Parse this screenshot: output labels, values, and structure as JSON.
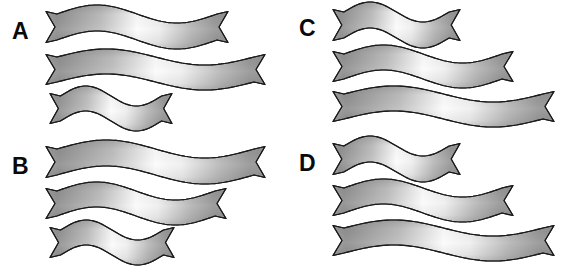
{
  "figure": {
    "width": 574,
    "height": 269,
    "background_color": "#ffffff",
    "panel_count": 4,
    "ribbons_per_panel": 3
  },
  "style": {
    "ribbon_outline_color": "#1a1a1a",
    "ribbon_outline_width": 1.15,
    "gradient_left_color": "#9a9a9a",
    "gradient_mid_color": "#fbfbfb",
    "gradient_right_color": "#8f8f8f",
    "gradient_edge_shadow_color": "#6f6f6f",
    "label_color": "#0a0a0a",
    "label_font_size_px": 23
  },
  "panels": [
    {
      "id": "A",
      "label": "A",
      "label_x": 12,
      "label_y": 20,
      "origin_x": 0,
      "origin_y": 0,
      "length_order": "long, longest, short",
      "ribbons": [
        {
          "name": "ribbon-a-1",
          "index": 1,
          "x": 46,
          "y": 14,
          "length": 182,
          "thickness": 26,
          "wave_amplitude": 9,
          "wave_phase": 0,
          "size_label": "long"
        },
        {
          "name": "ribbon-a-2",
          "index": 2,
          "x": 46,
          "y": 57,
          "length": 219,
          "thickness": 25,
          "wave_amplitude": 8,
          "wave_phase": 0,
          "size_label": "longest"
        },
        {
          "name": "ribbon-a-3",
          "index": 3,
          "x": 50,
          "y": 96,
          "length": 122,
          "thickness": 25,
          "wave_amplitude": 10,
          "wave_phase": 0,
          "size_label": "short"
        }
      ]
    },
    {
      "id": "B",
      "label": "B",
      "label_x": 12,
      "label_y": 155,
      "origin_x": 0,
      "origin_y": 135,
      "length_order": "longest, medium, short",
      "ribbons": [
        {
          "name": "ribbon-b-1",
          "index": 1,
          "x": 46,
          "y": 14,
          "length": 219,
          "thickness": 26,
          "wave_amplitude": 9,
          "wave_phase": 0,
          "size_label": "longest"
        },
        {
          "name": "ribbon-b-2",
          "index": 2,
          "x": 46,
          "y": 56,
          "length": 180,
          "thickness": 25,
          "wave_amplitude": 9,
          "wave_phase": 0,
          "size_label": "medium"
        },
        {
          "name": "ribbon-b-3",
          "index": 3,
          "x": 50,
          "y": 95,
          "length": 124,
          "thickness": 25,
          "wave_amplitude": 10,
          "wave_phase": 0,
          "size_label": "short"
        }
      ]
    },
    {
      "id": "C",
      "label": "C",
      "label_x": 12,
      "label_y": 17,
      "origin_x": 287,
      "origin_y": 0,
      "length_order": "short, medium, longest",
      "ribbons": [
        {
          "name": "ribbon-c-1",
          "index": 1,
          "x": 46,
          "y": 12,
          "length": 127,
          "thickness": 26,
          "wave_amplitude": 10,
          "wave_phase": 0,
          "size_label": "short"
        },
        {
          "name": "ribbon-c-2",
          "index": 2,
          "x": 46,
          "y": 54,
          "length": 180,
          "thickness": 25,
          "wave_amplitude": 9,
          "wave_phase": 0,
          "size_label": "medium"
        },
        {
          "name": "ribbon-c-3",
          "index": 3,
          "x": 46,
          "y": 94,
          "length": 221,
          "thickness": 25,
          "wave_amplitude": 8,
          "wave_phase": 0,
          "size_label": "longest"
        }
      ]
    },
    {
      "id": "D",
      "label": "D",
      "label_x": 12,
      "label_y": 152,
      "origin_x": 287,
      "origin_y": 135,
      "length_order": "short, medium, longest",
      "ribbons": [
        {
          "name": "ribbon-d-1",
          "index": 1,
          "x": 46,
          "y": 11,
          "length": 127,
          "thickness": 26,
          "wave_amplitude": 10,
          "wave_phase": 0,
          "size_label": "short"
        },
        {
          "name": "ribbon-d-2",
          "index": 2,
          "x": 46,
          "y": 53,
          "length": 180,
          "thickness": 25,
          "wave_amplitude": 9,
          "wave_phase": 0,
          "size_label": "medium"
        },
        {
          "name": "ribbon-d-3",
          "index": 3,
          "x": 46,
          "y": 93,
          "length": 221,
          "thickness": 25,
          "wave_amplitude": 8,
          "wave_phase": 0,
          "size_label": "longest"
        }
      ]
    }
  ]
}
